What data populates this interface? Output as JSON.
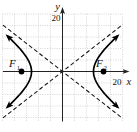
{
  "labels": {
    "y_axis": "y",
    "x_axis": "x",
    "y_scale": "20",
    "x_scale": "20",
    "focus1": "F",
    "focus1_sub": "1",
    "focus2": "F",
    "focus2_sub": "2"
  },
  "chart_data": {
    "type": "line",
    "subtype": "hyperbola",
    "title": "",
    "xlabel": "x",
    "ylabel": "y",
    "x_axis_scale_label": "20",
    "y_axis_scale_label": "20",
    "grid": true,
    "legend": false,
    "series": [
      {
        "name": "left branch",
        "description": "solid bold curve opening left, vertex on negative x-axis, arrowheads at both ends"
      },
      {
        "name": "right branch",
        "description": "solid bold curve opening right, vertex on positive x-axis, arrowheads at both ends"
      }
    ],
    "asymptotes": {
      "style": "dashed",
      "slopes": [
        0.75,
        -0.75
      ],
      "through": [
        0,
        0
      ]
    },
    "foci_labels": [
      "F1",
      "F2"
    ],
    "estimated_values": {
      "center": [
        0,
        0
      ],
      "vertices_x": [
        -12,
        12
      ],
      "foci_x": [
        -15,
        15
      ],
      "equation": "x^2/144 - y^2/81 = 1"
    }
  },
  "render": {
    "grid": {
      "vx0": 2.5,
      "vdx": 12,
      "vcount": 11,
      "vy0": 14,
      "vy1": 121.5,
      "hy0": 14,
      "hdy": 11.5,
      "hcount": 10,
      "hx0": 2.5,
      "hx1": 122.5
    },
    "axes": {
      "x_line": [
        3,
        71.5,
        126.5,
        71.5
      ],
      "y_line": [
        62.5,
        121.5,
        62.5,
        10
      ]
    },
    "asymptote_lines": [
      [
        3,
        25.1,
        122.8,
        118.5
      ],
      [
        3,
        117.9,
        122.8,
        24.5
      ]
    ],
    "hyperbola": {
      "cx": 62.5,
      "cy": 71.5,
      "a": 31,
      "b": 24.2,
      "tmax": 1.17,
      "step": 0.065
    },
    "foci_px": [
      [
        21.5,
        71.5
      ],
      [
        103.5,
        71.5
      ]
    ],
    "dot_r": 2.9,
    "colors": {
      "grid": "#b4b4b4",
      "axis": "#222222",
      "curve": "#000000",
      "asymptote": "#111111",
      "text": "#111111"
    }
  }
}
